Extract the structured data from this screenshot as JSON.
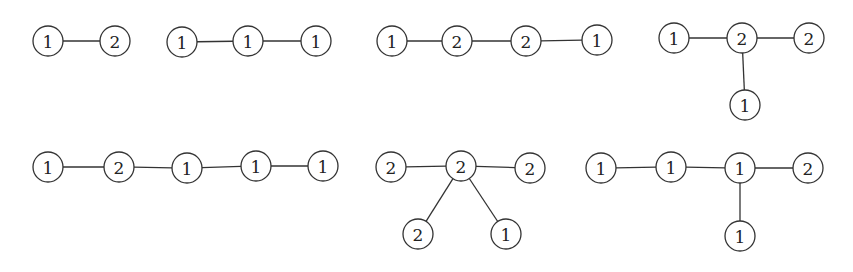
{
  "diagram": {
    "node_radius": 15,
    "colors": {
      "stroke": "#333333",
      "fill": "#ffffff",
      "text": "#222222",
      "background": "#ffffff"
    },
    "graphs": [
      {
        "id": "g1",
        "nodes": [
          {
            "label": "1",
            "x": 48,
            "y": 41
          },
          {
            "label": "2",
            "x": 115,
            "y": 41
          }
        ],
        "edges": [
          [
            0,
            1
          ]
        ]
      },
      {
        "id": "g2",
        "nodes": [
          {
            "label": "1",
            "x": 182,
            "y": 42
          },
          {
            "label": "1",
            "x": 248,
            "y": 41
          },
          {
            "label": "1",
            "x": 316,
            "y": 41
          }
        ],
        "edges": [
          [
            0,
            1
          ],
          [
            1,
            2
          ]
        ]
      },
      {
        "id": "g3",
        "nodes": [
          {
            "label": "1",
            "x": 392,
            "y": 41
          },
          {
            "label": "2",
            "x": 457,
            "y": 41
          },
          {
            "label": "2",
            "x": 526,
            "y": 41
          },
          {
            "label": "1",
            "x": 597,
            "y": 40
          }
        ],
        "edges": [
          [
            0,
            1
          ],
          [
            1,
            2
          ],
          [
            2,
            3
          ]
        ]
      },
      {
        "id": "g4",
        "nodes": [
          {
            "label": "1",
            "x": 674,
            "y": 38
          },
          {
            "label": "2",
            "x": 742,
            "y": 38
          },
          {
            "label": "2",
            "x": 809,
            "y": 38
          },
          {
            "label": "1",
            "x": 745,
            "y": 105
          }
        ],
        "edges": [
          [
            0,
            1
          ],
          [
            1,
            2
          ],
          [
            1,
            3
          ]
        ]
      },
      {
        "id": "g5",
        "nodes": [
          {
            "label": "1",
            "x": 48,
            "y": 167
          },
          {
            "label": "2",
            "x": 119,
            "y": 167
          },
          {
            "label": "1",
            "x": 187,
            "y": 168
          },
          {
            "label": "1",
            "x": 256,
            "y": 166
          },
          {
            "label": "1",
            "x": 323,
            "y": 166
          }
        ],
        "edges": [
          [
            0,
            1
          ],
          [
            1,
            2
          ],
          [
            2,
            3
          ],
          [
            3,
            4
          ]
        ]
      },
      {
        "id": "g6",
        "nodes": [
          {
            "label": "2",
            "x": 391,
            "y": 167
          },
          {
            "label": "2",
            "x": 461,
            "y": 166
          },
          {
            "label": "2",
            "x": 530,
            "y": 168
          },
          {
            "label": "2",
            "x": 418,
            "y": 234
          },
          {
            "label": "1",
            "x": 506,
            "y": 234
          }
        ],
        "edges": [
          [
            0,
            1
          ],
          [
            1,
            2
          ],
          [
            1,
            3
          ],
          [
            1,
            4
          ]
        ]
      },
      {
        "id": "g7",
        "nodes": [
          {
            "label": "1",
            "x": 601,
            "y": 168
          },
          {
            "label": "1",
            "x": 671,
            "y": 167
          },
          {
            "label": "1",
            "x": 740,
            "y": 168
          },
          {
            "label": "2",
            "x": 808,
            "y": 168
          },
          {
            "label": "1",
            "x": 740,
            "y": 236
          }
        ],
        "edges": [
          [
            0,
            1
          ],
          [
            1,
            2
          ],
          [
            2,
            3
          ],
          [
            2,
            4
          ]
        ]
      }
    ]
  }
}
